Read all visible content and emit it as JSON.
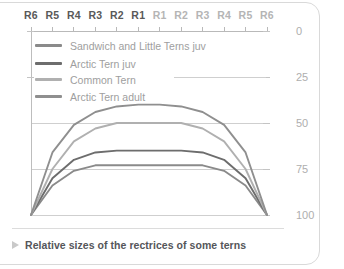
{
  "caption": {
    "marker": "triangle-right-icon",
    "text": "Relative sizes of the rectrices of some terns"
  },
  "chart_data": {
    "type": "line",
    "title": "Relative sizes of the rectrices of some terns",
    "xlabel": "",
    "ylabel": "",
    "grid": true,
    "gridlines": [
      50,
      75
    ],
    "legend_position": "top-left",
    "y_inverted": true,
    "ylim": [
      0,
      100
    ],
    "yticks": [
      0,
      25,
      50,
      75,
      100
    ],
    "ytick_labels": [
      "0",
      "25",
      "50",
      "75",
      "100"
    ],
    "categories": [
      "R6",
      "R5",
      "R4",
      "R3",
      "R2",
      "R1",
      "R1",
      "R2",
      "R3",
      "R4",
      "R5",
      "R6"
    ],
    "series": [
      {
        "name": "Sandwich and Little Terns juv",
        "color": "#8a8a8a",
        "values": [
          100,
          84,
          76,
          73,
          73,
          73,
          73,
          73,
          73,
          76,
          84,
          100
        ]
      },
      {
        "name": "Arctic Tern juv",
        "color": "#6d6d6d",
        "values": [
          100,
          80,
          70,
          66,
          65,
          65,
          65,
          65,
          66,
          70,
          80,
          100
        ]
      },
      {
        "name": "Common Tern",
        "color": "#b0b0b0",
        "values": [
          100,
          75,
          60,
          53,
          50,
          50,
          50,
          50,
          53,
          60,
          75,
          100
        ]
      },
      {
        "name": "Arctic Tern adult",
        "color": "#8f8f8f",
        "values": [
          100,
          66,
          51,
          44,
          41,
          40,
          40,
          41,
          44,
          51,
          66,
          100
        ]
      }
    ]
  },
  "axis": {
    "x_labels_left": [
      "R6",
      "R5",
      "R4",
      "R3",
      "R2",
      "R1"
    ],
    "x_labels_right": [
      "R1",
      "R2",
      "R3",
      "R4",
      "R5",
      "R6"
    ]
  },
  "legend": {
    "items": [
      {
        "label": "Sandwich and Little Terns juv",
        "color": "#8a8a8a"
      },
      {
        "label": "Arctic Tern juv",
        "color": "#6d6d6d"
      },
      {
        "label": "Common Tern",
        "color": "#b0b0b0"
      },
      {
        "label": "Arctic Tern adult",
        "color": "#8f8f8f"
      }
    ]
  }
}
